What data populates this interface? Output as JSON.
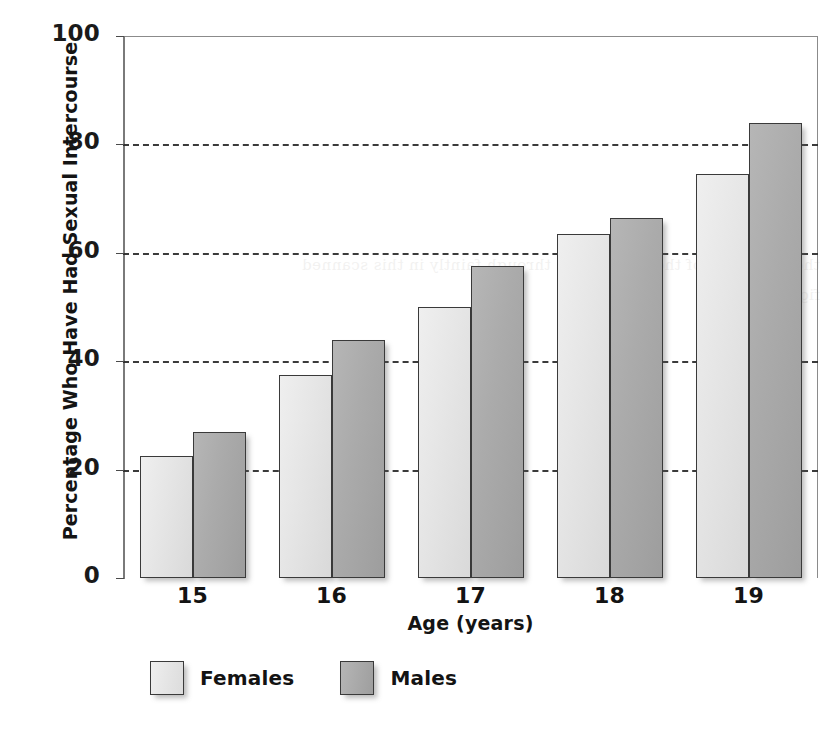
{
  "chart_data": {
    "type": "bar",
    "title": "",
    "xlabel": "Age (years)",
    "ylabel": "Percentage Who Have Had Sexual Intercourse",
    "categories": [
      "15",
      "16",
      "17",
      "18",
      "19"
    ],
    "series": [
      {
        "name": "Females",
        "values": [
          22.5,
          37.5,
          50.0,
          63.5,
          74.5
        ],
        "color": "#e6e6e6"
      },
      {
        "name": "Males",
        "values": [
          27.0,
          44.0,
          57.5,
          66.5,
          84.0
        ],
        "color": "#ababab"
      }
    ],
    "ylim": [
      0,
      100
    ],
    "yticks": [
      0,
      20,
      40,
      60,
      80,
      100
    ],
    "ytick_labels": [
      "0",
      "20",
      "40",
      "60",
      "80",
      "100"
    ],
    "grid": true,
    "grid_style": "dashed-horizontal",
    "grid_values": [
      20,
      40,
      60,
      80
    ],
    "legend_position": "bottom-left",
    "bar_outline_color": "#3a3a3a",
    "axis_color": "#7a7a7a"
  },
  "legend": {
    "items": [
      {
        "label": "Females",
        "swatch": "female"
      },
      {
        "label": "Males",
        "swatch": "male"
      }
    ]
  },
  "artifact": {
    "bleed_text": "the other side of the page shows through faintly in this scanned figure region"
  }
}
